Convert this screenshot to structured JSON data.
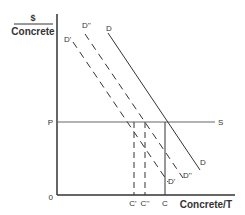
{
  "diagram": {
    "y_axis_label_top": "$",
    "y_axis_label_bottom": "Concrete",
    "x_axis_label": "Concrete/T",
    "origin_label": "0",
    "price_label": "P",
    "supply_label": "S",
    "demand_curves": [
      {
        "name": "D",
        "top_label": "D",
        "bottom_label": "D",
        "style": "solid"
      },
      {
        "name": "D''",
        "top_label": "D''",
        "bottom_label": "D''",
        "style": "dashed"
      },
      {
        "name": "D'",
        "top_label": "D'",
        "bottom_label": "D'",
        "style": "dashed"
      }
    ],
    "quantity_labels": {
      "c_prime": "C'",
      "c_double_prime": "C''",
      "c": "C"
    },
    "colors": {
      "line": "#333333",
      "supply": "#666666"
    }
  }
}
